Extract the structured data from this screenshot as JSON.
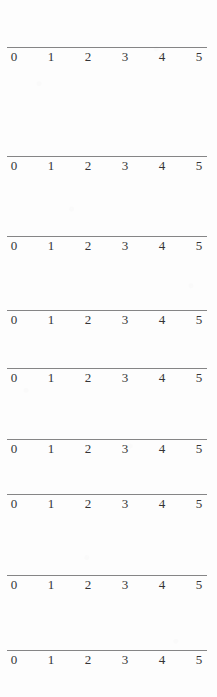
{
  "document": {
    "kind": "number-line-worksheet",
    "page_background_color": "#fdfdfd",
    "rule_color": "#7e7e80",
    "label_color": "#343436"
  },
  "axis": {
    "tick_labels": [
      "0",
      "1",
      "2",
      "3",
      "4",
      "5"
    ],
    "tick_positions_px": [
      14,
      51,
      88,
      125,
      162,
      199
    ],
    "line_start_px": 7,
    "line_end_px": 207
  },
  "number_lines": [
    {
      "id": "number-line-1",
      "top_px": 47
    },
    {
      "id": "number-line-2",
      "top_px": 156
    },
    {
      "id": "number-line-3",
      "top_px": 236
    },
    {
      "id": "number-line-4",
      "top_px": 310
    },
    {
      "id": "number-line-5",
      "top_px": 368
    },
    {
      "id": "number-line-6",
      "top_px": 439
    },
    {
      "id": "number-line-7",
      "top_px": 494
    },
    {
      "id": "number-line-8",
      "top_px": 575
    },
    {
      "id": "number-line-9",
      "top_px": 650
    }
  ],
  "chart_data": {
    "type": "line",
    "title": "",
    "xlabel": "",
    "ylabel": "",
    "repeat_count": 9,
    "x": [
      0,
      1,
      2,
      3,
      4,
      5
    ],
    "tick_labels": [
      "0",
      "1",
      "2",
      "3",
      "4",
      "5"
    ],
    "xlim": [
      0,
      5
    ],
    "grid": false,
    "legend": "none",
    "series": []
  }
}
